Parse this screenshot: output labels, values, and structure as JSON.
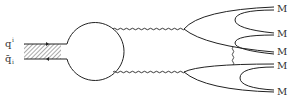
{
  "diagram": {
    "type": "feynman-diagram",
    "incoming": {
      "quark_label": "q",
      "quark_index": "i",
      "antiquark_label": "q̄",
      "antiquark_index": "i"
    },
    "outgoing_labels": [
      "M",
      "M",
      "M",
      "M",
      "M"
    ],
    "colors": {
      "line": "#222222",
      "text": "#333333",
      "background": "#ffffff"
    }
  }
}
